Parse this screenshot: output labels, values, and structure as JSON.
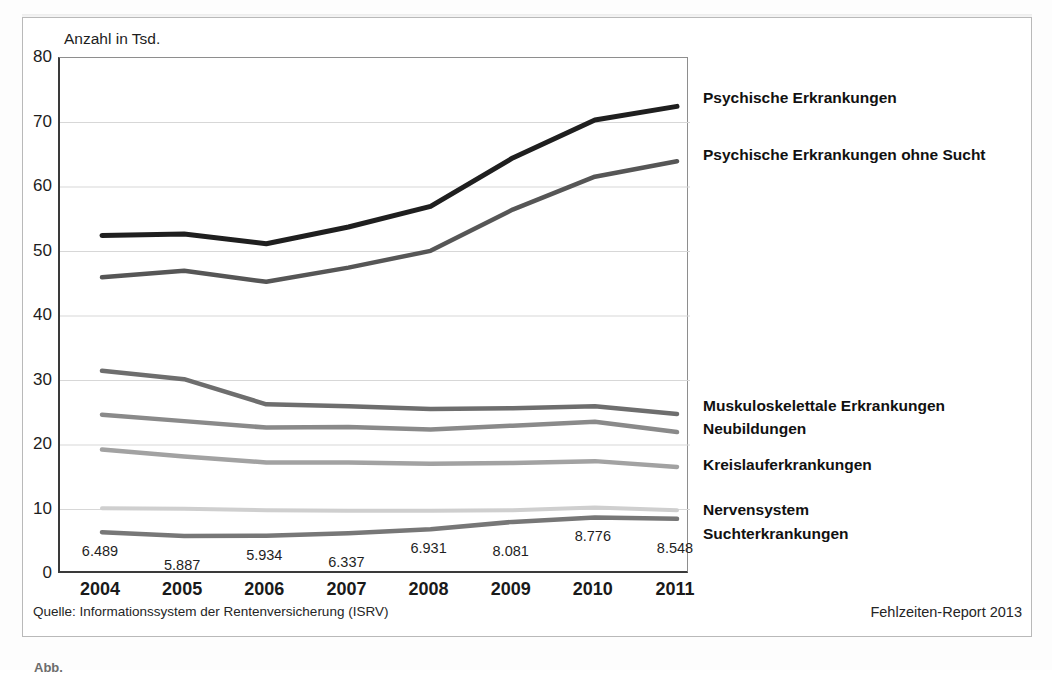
{
  "axis_title": "Anzahl in Tsd.",
  "source_note": "Quelle: Informationssystem der Rentenversicherung (ISRV)",
  "report_note": "Fehlzeiten-Report 2013",
  "caption": "Abb.",
  "legend": [
    {
      "label": "Psychische Erkrankungen",
      "color": "#1f1f1f",
      "top": 88
    },
    {
      "label": "Psychische Erkrankungen ohne Sucht",
      "color": "#565656",
      "top": 145
    },
    {
      "label": "Muskuloskelettale Erkrankungen",
      "color": "#6e6e6e",
      "top": 396
    },
    {
      "label": "Neubildungen",
      "color": "#8a8a8a",
      "top": 419
    },
    {
      "label": "Kreislauferkrankungen",
      "color": "#a2a2a2",
      "top": 455
    },
    {
      "label": "Nervensystem",
      "color": "#cfcfcf",
      "top": 500
    },
    {
      "label": "Suchterkrankungen",
      "color": "#777777",
      "top": 524
    }
  ],
  "chart_data": {
    "type": "line",
    "title": "",
    "xlabel": "",
    "ylabel": "Anzahl in Tsd.",
    "ylim": [
      0,
      80
    ],
    "yticks": [
      0,
      10,
      20,
      30,
      40,
      50,
      60,
      70,
      80
    ],
    "grid": true,
    "legend_position": "right",
    "categories": [
      "2004",
      "2005",
      "2006",
      "2007",
      "2008",
      "2009",
      "2010",
      "2011"
    ],
    "series": [
      {
        "name": "Psychische Erkrankungen",
        "color": "#1f1f1f",
        "width": 5,
        "values": [
          52.5,
          52.7,
          51.2,
          53.8,
          57.0,
          64.5,
          70.4,
          72.5
        ]
      },
      {
        "name": "Psychische Erkrankungen ohne Sucht",
        "color": "#565656",
        "width": 4.5,
        "values": [
          46.0,
          47.0,
          45.3,
          47.5,
          50.1,
          56.5,
          61.6,
          64.0
        ]
      },
      {
        "name": "Muskuloskelettale Erkrankungen",
        "color": "#6e6e6e",
        "width": 4.5,
        "values": [
          31.5,
          30.2,
          26.3,
          26.0,
          25.6,
          25.7,
          26.0,
          24.8
        ]
      },
      {
        "name": "Neubildungen",
        "color": "#8a8a8a",
        "width": 4.5,
        "values": [
          24.7,
          23.7,
          22.7,
          22.8,
          22.4,
          23.0,
          23.6,
          22.0
        ]
      },
      {
        "name": "Kreislauferkrankungen",
        "color": "#a2a2a2",
        "width": 4.5,
        "values": [
          19.3,
          18.2,
          17.3,
          17.3,
          17.1,
          17.2,
          17.5,
          16.6
        ]
      },
      {
        "name": "Nervensystem",
        "color": "#cfcfcf",
        "width": 4,
        "values": [
          10.2,
          10.1,
          9.9,
          9.8,
          9.8,
          9.9,
          10.3,
          9.9
        ]
      },
      {
        "name": "Suchterkrankungen",
        "color": "#777777",
        "width": 4.5,
        "values": [
          6.489,
          5.887,
          5.934,
          6.337,
          6.931,
          8.081,
          8.776,
          8.548
        ],
        "data_labels": [
          "6.489",
          "5.887",
          "5.934",
          "6.337",
          "6.931",
          "8.081",
          "8.776",
          "8.548"
        ]
      }
    ]
  }
}
